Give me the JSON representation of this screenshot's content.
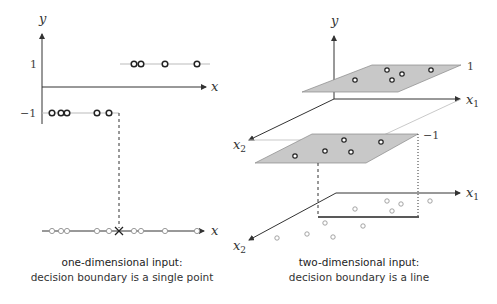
{
  "left_panel": {
    "axis_labels": {
      "y": "y",
      "x_top": "x",
      "x_bottom": "x"
    },
    "tick_labels": {
      "pos": "1",
      "neg": "−1"
    },
    "positive_points_x": [
      134,
      141,
      165,
      197
    ],
    "negative_points_x": [
      52,
      61,
      67,
      97,
      109
    ],
    "boundary_x": 119,
    "caption": {
      "title": "one-dimensional input:",
      "subtitle": "decision boundary is a single point"
    }
  },
  "right_panel": {
    "axis_labels": {
      "y": "y",
      "x1_top": "x",
      "x1_top_sub": "1",
      "x2_top": "x",
      "x2_top_sub": "2",
      "x1_bottom": "x",
      "x1_bottom_sub": "1",
      "x2_bottom": "x",
      "x2_bottom_sub": "2"
    },
    "plane_labels": {
      "upper": "1",
      "lower": "−1"
    },
    "upper_plane_points": [
      [
        355,
        80
      ],
      [
        387,
        70
      ],
      [
        402,
        74
      ],
      [
        392,
        80
      ],
      [
        431,
        70
      ]
    ],
    "lower_plane_points": [
      [
        344,
        140
      ],
      [
        381,
        142
      ],
      [
        325,
        151
      ],
      [
        351,
        152
      ],
      [
        295,
        156
      ]
    ],
    "floor_points": [
      [
        355,
        209
      ],
      [
        387,
        201
      ],
      [
        401,
        204
      ],
      [
        392,
        211
      ],
      [
        430,
        201
      ],
      [
        325,
        223
      ],
      [
        363,
        226
      ],
      [
        307,
        234
      ],
      [
        333,
        237
      ],
      [
        277,
        238
      ]
    ],
    "caption": {
      "title": "two-dimensional input:",
      "subtitle": "decision boundary is a line"
    }
  },
  "colors": {
    "plane_fill": "#c8c8c8",
    "axis": "#333333",
    "guide": "#bbbbbb",
    "point_dark": "#222222",
    "point_light": "#999999"
  }
}
